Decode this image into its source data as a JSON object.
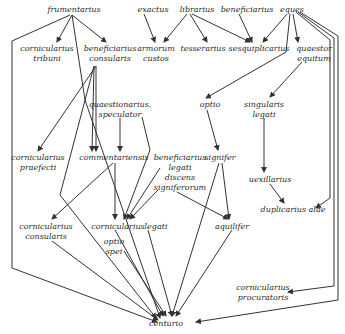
{
  "diagram": {
    "type": "hierarchy",
    "title": "",
    "nodes": [
      {
        "id": "frumentarius",
        "label": "frumentarius",
        "x": 74,
        "y": 5
      },
      {
        "id": "exactus",
        "label": "exactus",
        "x": 153,
        "y": 5
      },
      {
        "id": "librarius",
        "label": "librarius",
        "x": 197,
        "y": 5
      },
      {
        "id": "beneficiarius",
        "label": "beneficiarius",
        "x": 247,
        "y": 5
      },
      {
        "id": "eques",
        "label": "eques",
        "x": 292,
        "y": 5
      },
      {
        "id": "cornicularius_tribuni",
        "label": "cornicularius\ntribuni",
        "x": 47,
        "y": 44
      },
      {
        "id": "beneficiarius_consularis",
        "label": "beneficiarius\nconsularis",
        "x": 110,
        "y": 44
      },
      {
        "id": "armorum_custos",
        "label": "armorum\ncustos",
        "x": 156,
        "y": 44
      },
      {
        "id": "tesserarius",
        "label": "tesserarius",
        "x": 203,
        "y": 44
      },
      {
        "id": "sesquiplicarius",
        "label": "sesquiplicarius",
        "x": 259,
        "y": 44
      },
      {
        "id": "quaestor_equitum",
        "label": "quaestor\nequitum",
        "x": 314,
        "y": 44
      },
      {
        "id": "quaestionarius_speculator",
        "label": "quaestionarius,\nspeculator",
        "x": 120,
        "y": 100
      },
      {
        "id": "optio",
        "label": "optio",
        "x": 210,
        "y": 100
      },
      {
        "id": "singularis_legati",
        "label": "singularis\nlegati",
        "x": 264,
        "y": 100
      },
      {
        "id": "cornicularius_praefecti",
        "label": "cornicularius\npraefecti",
        "x": 38,
        "y": 153
      },
      {
        "id": "commentariensis",
        "label": "commentariensis",
        "x": 114,
        "y": 153
      },
      {
        "id": "beneficiarius_legati_discens",
        "label": "beneficiarius\nlegati\ndiscens\nsigniferorum",
        "x": 180,
        "y": 153
      },
      {
        "id": "signifer",
        "label": "signifer",
        "x": 220,
        "y": 153
      },
      {
        "id": "uexillarius",
        "label": "uexillarius",
        "x": 270,
        "y": 175
      },
      {
        "id": "duplicarius_alae",
        "label": "duplicarius alae",
        "x": 293,
        "y": 205
      },
      {
        "id": "cornicularius_consularis",
        "label": "cornicularius\nconsularis",
        "x": 46,
        "y": 222
      },
      {
        "id": "cornicularius",
        "label": "cornicularius",
        "x": 118,
        "y": 222
      },
      {
        "id": "legati",
        "label": "legati",
        "x": 156,
        "y": 222
      },
      {
        "id": "aquilifer",
        "label": "aquilifer",
        "x": 232,
        "y": 222
      },
      {
        "id": "optio_spei",
        "label": "optio\nspei",
        "x": 114,
        "y": 237
      },
      {
        "id": "cornicularius_procuratoris",
        "label": "cornicularius\nprocuratoris",
        "x": 263,
        "y": 283
      },
      {
        "id": "centurio",
        "label": "centurio",
        "x": 166,
        "y": 319
      }
    ],
    "edges": [
      {
        "from": "frumentarius",
        "to": "cornicularius_tribuni",
        "points": [
          [
            72,
            15
          ],
          [
            57,
            42
          ]
        ]
      },
      {
        "from": "frumentarius",
        "to": "beneficiarius_consularis",
        "points": [
          [
            72,
            15
          ],
          [
            106,
            42
          ]
        ]
      },
      {
        "from": "frumentarius",
        "to": "centurio_left_route",
        "points": [
          [
            70,
            15
          ],
          [
            12,
            41
          ],
          [
            12,
            268
          ],
          [
            157,
            322
          ]
        ]
      },
      {
        "from": "frumentarius",
        "to": "centurio",
        "points": [
          [
            72,
            15
          ],
          [
            85,
            100
          ],
          [
            160,
            318
          ]
        ]
      },
      {
        "from": "exactus",
        "to": "armorum_custos",
        "points": [
          [
            144,
            14
          ],
          [
            155,
            42
          ]
        ]
      },
      {
        "from": "librarius",
        "to": "armorum_custos",
        "points": [
          [
            187,
            14
          ],
          [
            164,
            42
          ]
        ]
      },
      {
        "from": "librarius",
        "to": "tesserarius",
        "points": [
          [
            190,
            14
          ],
          [
            207,
            42
          ]
        ]
      },
      {
        "from": "librarius",
        "to": "sesquiplicarius",
        "points": [
          [
            192,
            14
          ],
          [
            250,
            42
          ]
        ]
      },
      {
        "from": "beneficiarius",
        "to": "sesquiplicarius",
        "points": [
          [
            239,
            14
          ],
          [
            252,
            42
          ]
        ]
      },
      {
        "from": "eques",
        "to": "sesquiplicarius",
        "points": [
          [
            287,
            14
          ],
          [
            263,
            42
          ]
        ]
      },
      {
        "from": "eques",
        "to": "optio",
        "points": [
          [
            290,
            14
          ],
          [
            286,
            52
          ],
          [
            206,
            98
          ]
        ]
      },
      {
        "from": "eques",
        "to": "quaestor_equitum",
        "points": [
          [
            293,
            14
          ],
          [
            298,
            42
          ]
        ]
      },
      {
        "from": "eques",
        "to": "duplicarius_alae",
        "points": [
          [
            296,
            12
          ],
          [
            330,
            40
          ],
          [
            330,
            198
          ],
          [
            316,
            208
          ]
        ]
      },
      {
        "from": "eques",
        "to": "cornicularius_procuratoris",
        "points": [
          [
            298,
            12
          ],
          [
            334,
            38
          ],
          [
            334,
            286
          ],
          [
            288,
            292
          ]
        ]
      },
      {
        "from": "eques",
        "to": "centurio",
        "points": [
          [
            300,
            12
          ],
          [
            338,
            36
          ],
          [
            338,
            300
          ],
          [
            196,
            322
          ]
        ]
      },
      {
        "from": "quaestor_equitum",
        "to": "singularis_legati",
        "points": [
          [
            302,
            62
          ],
          [
            270,
            97
          ]
        ]
      },
      {
        "from": "beneficiarius_consularis",
        "to": "cornicularius_praefecti",
        "points": [
          [
            96,
            66
          ],
          [
            38,
            151
          ]
        ]
      },
      {
        "from": "beneficiarius_consularis",
        "to": "commentariensis",
        "points": [
          [
            94,
            66
          ],
          [
            92,
            151
          ]
        ]
      },
      {
        "from": "beneficiarius_consularis",
        "to": "commentariensis_2",
        "points": [
          [
            96,
            66
          ],
          [
            96,
            151
          ]
        ]
      },
      {
        "from": "beneficiarius_consularis",
        "to": "centurio_via_cross",
        "points": [
          [
            94,
            66
          ],
          [
            60,
            195
          ],
          [
            156,
            318
          ]
        ]
      },
      {
        "from": "quaestionarius_speculator",
        "to": "commentariensis",
        "points": [
          [
            120,
            118
          ],
          [
            120,
            151
          ]
        ]
      },
      {
        "from": "quaestionarius_speculator",
        "to": "cornicularius",
        "points": [
          [
            142,
            117
          ],
          [
            150,
            150
          ],
          [
            124,
            219
          ]
        ]
      },
      {
        "from": "commentariensis",
        "to": "cornicularius",
        "points": [
          [
            115,
            163
          ],
          [
            115,
            219
          ]
        ]
      },
      {
        "from": "commentariensis",
        "to": "cornicularius_consularis",
        "points": [
          [
            113,
            163
          ],
          [
            52,
            219
          ]
        ]
      },
      {
        "from": "beneficiarius_legati_discens",
        "to": "cornicularius",
        "points": [
          [
            160,
            168
          ],
          [
            127,
            219
          ]
        ]
      },
      {
        "from": "beneficiarius_legati_discens",
        "to": "cornicularius_2",
        "points": [
          [
            158,
            190
          ],
          [
            130,
            219
          ]
        ]
      },
      {
        "from": "beneficiarius_legati_discens",
        "to": "aquilifer",
        "points": [
          [
            177,
            192
          ],
          [
            228,
            219
          ]
        ]
      },
      {
        "from": "optio",
        "to": "signifer",
        "points": [
          [
            207,
            110
          ],
          [
            218,
            150
          ]
        ]
      },
      {
        "from": "singularis_legati",
        "to": "uexillarius",
        "points": [
          [
            264,
            118
          ],
          [
            264,
            172
          ]
        ]
      },
      {
        "from": "uexillarius",
        "to": "duplicarius_alae",
        "points": [
          [
            270,
            184
          ],
          [
            284,
            203
          ]
        ]
      },
      {
        "from": "signifer",
        "to": "aquilifer",
        "points": [
          [
            222,
            163
          ],
          [
            229,
            219
          ]
        ]
      },
      {
        "from": "signifer",
        "to": "centurio",
        "points": [
          [
            219,
            163
          ],
          [
            172,
            316
          ]
        ]
      },
      {
        "from": "cornicularius_consularis",
        "to": "centurio",
        "points": [
          [
            52,
            241
          ],
          [
            158,
            320
          ]
        ]
      },
      {
        "from": "cornicularius",
        "to": "centurio",
        "points": [
          [
            115,
            230
          ],
          [
            163,
            316
          ]
        ]
      },
      {
        "from": "optio_spei",
        "to": "centurio",
        "points": [
          [
            124,
            251
          ],
          [
            166,
            316
          ]
        ]
      },
      {
        "from": "legati",
        "to": "centurio",
        "points": [
          [
            148,
            230
          ],
          [
            172,
            316
          ]
        ]
      },
      {
        "from": "aquilifer",
        "to": "centurio",
        "points": [
          [
            232,
            230
          ],
          [
            176,
            316
          ]
        ]
      }
    ]
  }
}
